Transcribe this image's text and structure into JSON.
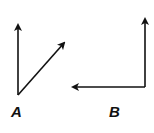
{
  "figures": [
    {
      "label": "A",
      "vectors": [
        {
          "name": "vertical",
          "from": [
            18,
            95
          ],
          "to": [
            18,
            25
          ]
        },
        {
          "name": "diagonal",
          "from": [
            18,
            95
          ],
          "to": [
            64,
            43
          ]
        }
      ]
    },
    {
      "label": "B",
      "vectors": [
        {
          "name": "vertical",
          "from": [
            145,
            87
          ],
          "to": [
            145,
            19
          ]
        },
        {
          "name": "horizontal",
          "from": [
            145,
            87
          ],
          "to": [
            73,
            87
          ]
        }
      ]
    }
  ],
  "colors": {
    "stroke": "#111111",
    "background": "#ffffff"
  }
}
